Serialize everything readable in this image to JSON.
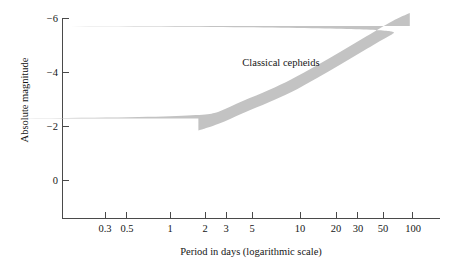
{
  "chart_data": {
    "type": "area",
    "title": "",
    "subtitle": "",
    "xlabel": "Period in days (logarithmic scale)",
    "ylabel": "Absolute magnitude",
    "xscale": "log",
    "xlim": [
      0.2,
      160
    ],
    "ylim": [
      1,
      -6.4
    ],
    "grid": false,
    "legend_position": "none",
    "x_ticks": [
      {
        "value": 0.3,
        "label": "0.3"
      },
      {
        "value": 0.5,
        "label": "0.5"
      },
      {
        "value": 1,
        "label": "1"
      },
      {
        "value": 2,
        "label": "2"
      },
      {
        "value": 3,
        "label": "3"
      },
      {
        "value": 5,
        "label": "5"
      },
      {
        "value": 10,
        "label": "10"
      },
      {
        "value": 20,
        "label": "20"
      },
      {
        "value": 30,
        "label": "30"
      },
      {
        "value": 50,
        "label": "50"
      },
      {
        "value": 100,
        "label": "100"
      }
    ],
    "y_ticks": [
      {
        "value": -6,
        "label": "−6"
      },
      {
        "value": -4,
        "label": "−4"
      },
      {
        "value": -2,
        "label": "−2"
      },
      {
        "value": 0,
        "label": "0"
      }
    ],
    "annotations": [
      {
        "text": "Classical cepheids",
        "x": 6.0,
        "y": -4.35
      }
    ],
    "series": [
      {
        "name": "Classical cepheids",
        "kind": "band",
        "fill_color": "#c3c3c3",
        "x": [
          1.7,
          2.5,
          4,
          6.5,
          10,
          16,
          26,
          42,
          68,
          95
        ],
        "y_upper": [
          -2.3,
          -2.55,
          -2.95,
          -3.35,
          -3.75,
          -4.25,
          -4.8,
          -5.35,
          -5.9,
          -6.2
        ],
        "y_lower": [
          -1.85,
          -2.1,
          -2.5,
          -2.9,
          -3.28,
          -3.78,
          -4.32,
          -4.88,
          -5.42,
          -5.72
        ]
      }
    ]
  },
  "axes": {
    "x_axis_name": "period-axis",
    "y_axis_name": "magnitude-axis"
  }
}
